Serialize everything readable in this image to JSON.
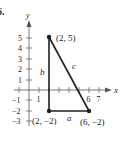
{
  "problem_number": "6.",
  "axes": {
    "x_label": "x",
    "y_label": "y",
    "x_ticks": [
      {
        "value": 1,
        "label": "1"
      },
      {
        "value": 6,
        "label": "6"
      },
      {
        "value": 7,
        "label": "7"
      }
    ],
    "y_ticks": [
      {
        "value": 5,
        "label": "5"
      },
      {
        "value": 4,
        "label": "4"
      },
      {
        "value": 3,
        "label": "3"
      },
      {
        "value": 2,
        "label": "2"
      },
      {
        "value": 1,
        "label": "1"
      },
      {
        "value": -1,
        "label": "−1"
      },
      {
        "value": -2,
        "label": "−2"
      },
      {
        "value": -3,
        "label": "−3"
      }
    ]
  },
  "points": [
    {
      "label": "(2, 5)",
      "x": 2,
      "y": 5
    },
    {
      "label": "(2, −2)",
      "x": 2,
      "y": -2
    },
    {
      "label": "(6, −2)",
      "x": 6,
      "y": -2
    }
  ],
  "sides": {
    "a": "a",
    "b": "b",
    "c": "c"
  },
  "colors": {
    "ink": "#231f20",
    "axis": "#555555"
  }
}
